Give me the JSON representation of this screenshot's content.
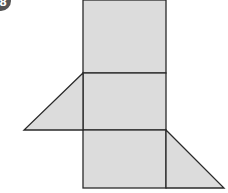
{
  "badge": {
    "label": "8"
  },
  "figure": {
    "fill": "#dcdcdc",
    "stroke": "#2a2a2a",
    "rectangles": [
      {
        "x": 83,
        "y": 0,
        "w": 83,
        "h": 73
      },
      {
        "x": 83,
        "y": 73,
        "w": 83,
        "h": 57
      },
      {
        "x": 83,
        "y": 130,
        "w": 83,
        "h": 58
      }
    ],
    "triangles": [
      {
        "points": "83,73 24,130 83,130"
      },
      {
        "points": "166,130 224,188 166,188"
      }
    ]
  }
}
